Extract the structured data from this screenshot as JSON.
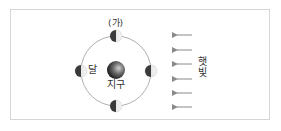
{
  "diagram": {
    "title_label": "(가)",
    "moon_label": "달",
    "earth_label": "지구",
    "sunlight_label": "햇빛",
    "orbit": {
      "cx": 116,
      "cy": 71,
      "r": 35
    },
    "earth": {
      "cx": 116,
      "cy": 70,
      "r": 9
    },
    "moons": [
      {
        "position": "top",
        "cx": 116,
        "cy": 36,
        "r": 6,
        "dark_side": "left",
        "lit_side": "right"
      },
      {
        "position": "left",
        "cx": 81,
        "cy": 71,
        "r": 6,
        "dark_side": "left",
        "lit_side": "right"
      },
      {
        "position": "right",
        "cx": 151,
        "cy": 71,
        "r": 6,
        "dark_side": "left",
        "lit_side": "right"
      },
      {
        "position": "bottom",
        "cx": 116,
        "cy": 106,
        "r": 6,
        "dark_side": "left",
        "lit_side": "right"
      }
    ],
    "sun_arrows": {
      "count": 6,
      "direction": "left",
      "x_start": 192,
      "x_end": 175,
      "y_positions": [
        35,
        50,
        64,
        79,
        93,
        107
      ]
    },
    "colors": {
      "orbit": "#9a9a9a",
      "moon_dark": "#3a3a3a",
      "moon_light": "#e8e8e8",
      "earth_dark": "#1a1a1a",
      "earth_light": "#c8c8c8",
      "arrow": "#8a8a8a",
      "frame_border": "#d6d6d6"
    }
  }
}
